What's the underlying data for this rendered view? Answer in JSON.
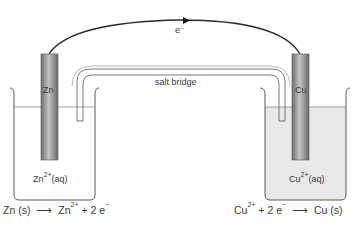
{
  "diagram": {
    "type": "galvanic-cell",
    "electron_label": "e⁻",
    "salt_bridge_label": "salt bridge",
    "left_half_cell": {
      "electrode_label": "Zn",
      "solution_ion": "Zn",
      "solution_charge": "2+",
      "solution_state": "(aq)",
      "equation": {
        "reactant": "Zn (s)",
        "arrow": "⟶",
        "product_ion": "Zn",
        "product_charge": "2+",
        "plus": "+",
        "electrons": "2 e",
        "electron_charge": "−"
      }
    },
    "right_half_cell": {
      "electrode_label": "Cu",
      "solution_ion": "Cu",
      "solution_charge": "2+",
      "solution_state": "(aq)",
      "equation": {
        "reactant_ion": "Cu",
        "reactant_charge": "2+",
        "plus": "+",
        "electrons": "2 e",
        "electron_charge": "−",
        "arrow": "⟶",
        "product": "Cu (s)"
      }
    },
    "colors": {
      "line": "#4a4a4a",
      "wire": "#2a2a2a",
      "electrode_dark": "#6e6e6e",
      "electrode_light": "#bdbdbd",
      "cu_solution": "#e9e9e9",
      "text": "#3a3a3a"
    }
  }
}
